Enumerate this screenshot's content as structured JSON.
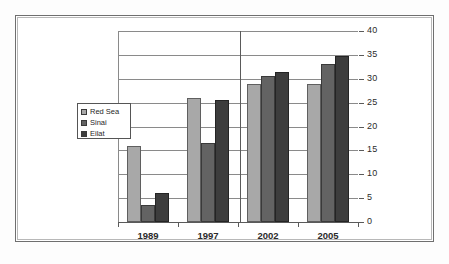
{
  "chart_data": {
    "type": "bar",
    "title": "",
    "subtitle": "",
    "xlabel": "",
    "ylabel": "",
    "categories": [
      "1989",
      "1997",
      "2002",
      "2005"
    ],
    "series": [
      {
        "name": "Red Sea",
        "color": "#a8a8a8",
        "values": [
          16,
          26,
          29,
          29
        ]
      },
      {
        "name": "Sinai",
        "color": "#636363",
        "values": [
          3.5,
          16.5,
          30.5,
          33
        ]
      },
      {
        "name": "Eilat",
        "color": "#3d3d3d",
        "values": [
          6,
          25.5,
          31.5,
          34.7
        ]
      }
    ],
    "ylim": [
      0,
      40
    ],
    "ytick_step": 5,
    "ytick_labels": [
      "0",
      "5",
      "10",
      "15",
      "20",
      "25",
      "30",
      "35",
      "40"
    ],
    "grid": true,
    "grid_axis": "y",
    "y_axis_position": "right",
    "legend_position": "center-left",
    "frame": true
  },
  "legend": {
    "entries": [
      {
        "label": "Red Sea"
      },
      {
        "label": "Sinai"
      },
      {
        "label": "Eilat"
      }
    ]
  },
  "colors": {
    "series_1": "#a8a8a8",
    "series_2": "#636363",
    "series_3": "#3d3d3d",
    "gridline": "#8a8a8a",
    "axis": "#5a5a5a",
    "frame_outer": "#6f6f6f",
    "frame_inner": "#b8b8b8",
    "text": "#2b2b2b",
    "background": "#ffffff"
  }
}
